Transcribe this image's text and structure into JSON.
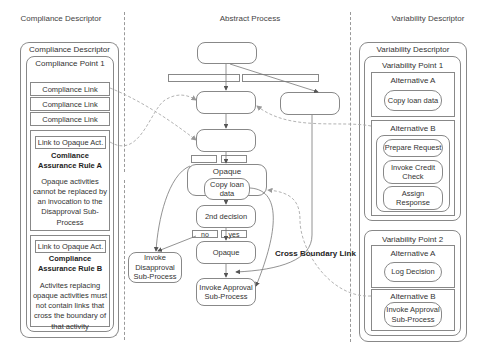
{
  "headers": {
    "compliance": "Compliance Descriptor",
    "abstract": "Abstract Process",
    "variability": "Variability Descriptor"
  },
  "compliance": {
    "title": "Compliance Descriptor",
    "point_title": "Compliance Point 1",
    "links": [
      "Compliance Link",
      "Compliance Link",
      "Compliance Link"
    ],
    "rules": [
      {
        "link": "Link to Opaque Act.",
        "title_line1": "Comliance",
        "title_line2": "Assurance Rule A",
        "desc": [
          "Opaque activities",
          "cannot be replaced by",
          "an invocation to the",
          "Disapproval Sub-",
          "Process"
        ]
      },
      {
        "link": "Link to Opaque Act.",
        "title_line1": "Compliance",
        "title_line2": "Assurance Rule B",
        "desc": [
          "Activites replacing",
          "opaque activities must",
          "not contain links that",
          "cross the boundary of",
          "that activity"
        ]
      }
    ]
  },
  "abstract": {
    "opaque_scope_label": "Opaque",
    "copy_loan": [
      "Copy loan",
      "data"
    ],
    "decision2": "2nd decision",
    "no_label": "no",
    "yes_label": "yes",
    "opaque2": "Opaque",
    "invoke_disapproval": [
      "Invoke",
      "Disapproval",
      "Sub-Process"
    ],
    "invoke_approval": [
      "Invoke Approval",
      "Sub-Process"
    ],
    "cross_boundary_label": "Cross Boundary Link"
  },
  "variability": {
    "title": "Variability Descriptor",
    "points": [
      {
        "title": "Variability Point 1",
        "alt_a": {
          "title": "Alternative A",
          "items": [
            "Copy loan data"
          ]
        },
        "alt_b": {
          "title": "Alternative B",
          "items": [
            [
              "Prepare Request"
            ],
            [
              "Invoke Credit",
              "Check"
            ],
            [
              "Assign",
              "Response"
            ]
          ]
        }
      },
      {
        "title": "Variability Point 2",
        "alt_a": {
          "title": "Alternative A",
          "items": [
            "Log Decision"
          ]
        },
        "alt_b": {
          "title": "Alternative B",
          "items": [
            [
              "Invoke Approval",
              "Sub-Process"
            ]
          ]
        }
      }
    ]
  },
  "colors": {
    "line": "#888888",
    "dashed_link": "#aaaaaa",
    "text": "#333333"
  }
}
